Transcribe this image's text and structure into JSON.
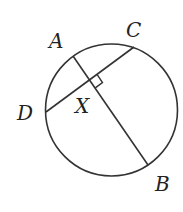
{
  "diagram": {
    "stroke_color": "#333333",
    "circle": {
      "cx": 111.5,
      "cy": 110,
      "r": 66
    },
    "points": {
      "A": {
        "label": "A",
        "x": 73,
        "y": 56
      },
      "B": {
        "label": "B",
        "x": 148,
        "y": 165
      },
      "C": {
        "label": "C",
        "x": 134,
        "y": 47
      },
      "D": {
        "label": "D",
        "x": 46,
        "y": 112
      },
      "X": {
        "label": "X",
        "x": 90,
        "y": 80
      }
    },
    "chords": [
      "AB",
      "CD"
    ],
    "right_angle_marker": "at X between XC and XB"
  }
}
